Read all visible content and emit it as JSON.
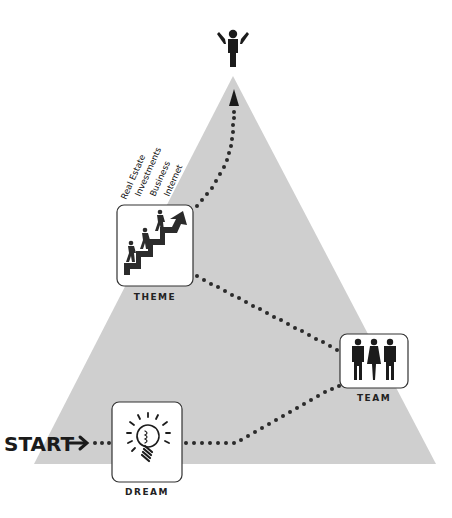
{
  "diagram": {
    "type": "success-pyramid",
    "colors": {
      "pyramid_fill": "#cfcfcf",
      "ink": "#1b1b1b",
      "box_fill": "#ffffff",
      "background": "#ffffff"
    },
    "start": {
      "label": "START",
      "arrow": "right-arrow-icon"
    },
    "steps": [
      {
        "id": "dream",
        "label": "DREAM",
        "icon": "lightbulb-icon"
      },
      {
        "id": "team",
        "label": "TEAM",
        "icon": "people-group-icon"
      },
      {
        "id": "theme",
        "label": "THEME",
        "icon": "climbing-stairs-icon"
      }
    ],
    "theme_markets": [
      "Real Estate",
      "Investments",
      "Business",
      "Internet"
    ],
    "goal": {
      "icon": "victory-person-icon"
    }
  }
}
